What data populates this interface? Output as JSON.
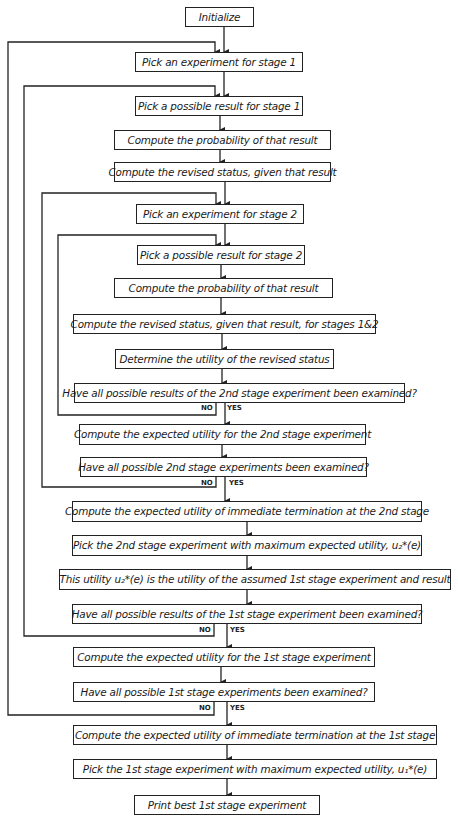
{
  "flowchart": {
    "nodes": [
      {
        "id": "initialize",
        "text": "Initialize"
      },
      {
        "id": "pick-exp-1",
        "text": "Pick an experiment for stage 1"
      },
      {
        "id": "pick-result-1",
        "text": "Pick a possible result for stage 1"
      },
      {
        "id": "prob-1",
        "text": "Compute the probability of that result"
      },
      {
        "id": "revised-1",
        "text": "Compute the revised status, given that result"
      },
      {
        "id": "pick-exp-2",
        "text": "Pick an experiment for stage 2"
      },
      {
        "id": "pick-result-2",
        "text": "Pick a possible result for stage 2"
      },
      {
        "id": "prob-2",
        "text": "Compute the probability of that result"
      },
      {
        "id": "revised-12",
        "text": "Compute the revised status, given that result, for stages 1&2"
      },
      {
        "id": "utility",
        "text": "Determine the utility of the revised status"
      },
      {
        "id": "q-results-2",
        "text": "Have all possible results of the 2nd stage experiment been examined?"
      },
      {
        "id": "eu-2",
        "text": "Compute the expected utility for the 2nd stage experiment"
      },
      {
        "id": "q-exps-2",
        "text": "Have all possible 2nd stage experiments been examined?"
      },
      {
        "id": "term-2",
        "text": "Compute the expected utility of immediate termination at the 2nd stage"
      },
      {
        "id": "max-2",
        "text": "Pick the 2nd stage experiment with maximum expected utility, u₂*(e)"
      },
      {
        "id": "assumed-1",
        "text": "This utility u₂*(e) is the utility of the assumed 1st stage experiment and result"
      },
      {
        "id": "q-results-1",
        "text": "Have all possible results of the 1st stage experiment been examined?"
      },
      {
        "id": "eu-1",
        "text": "Compute the expected utility for the 1st stage experiment"
      },
      {
        "id": "q-exps-1",
        "text": "Have all possible 1st stage experiments been examined?"
      },
      {
        "id": "term-1",
        "text": "Compute the expected utility of immediate termination at the 1st stage"
      },
      {
        "id": "max-1",
        "text": "Pick the 1st stage experiment with maximum expected utility, u₁*(e)"
      },
      {
        "id": "print",
        "text": "Print best 1st stage experiment"
      }
    ],
    "branch_labels": {
      "no": "NO",
      "yes": "YES"
    }
  }
}
